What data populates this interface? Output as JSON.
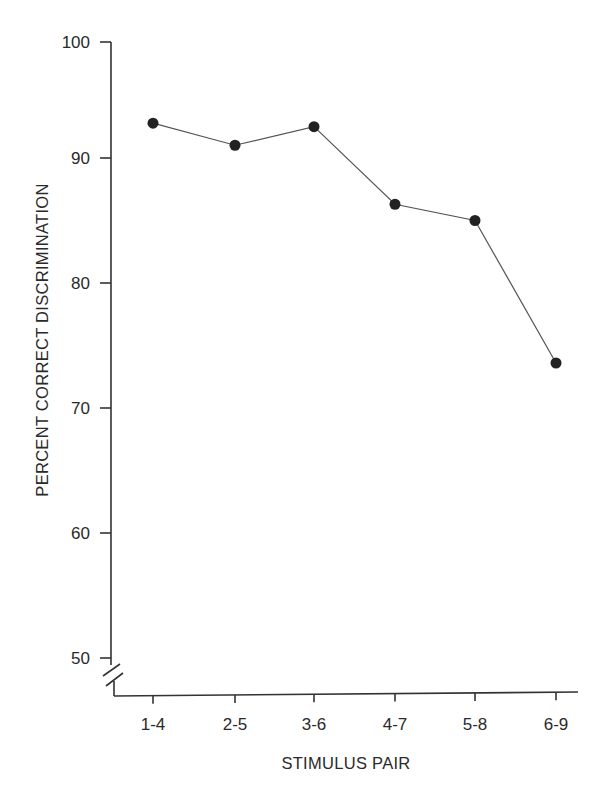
{
  "chart_data": {
    "type": "line",
    "title": "",
    "xlabel": "STIMULUS PAIR",
    "ylabel": "PERCENT CORRECT DISCRIMINATION",
    "categories": [
      "1-4",
      "2-5",
      "3-6",
      "4-7",
      "5-8",
      "6-9"
    ],
    "series": [
      {
        "name": "Percent correct",
        "values": [
          93.0,
          91.1,
          92.7,
          86.3,
          85.0,
          73.6
        ]
      }
    ],
    "ylim": [
      50,
      100
    ],
    "yticks": [
      50,
      60,
      70,
      80,
      90,
      100
    ],
    "ytick_labels": [
      "50",
      "60",
      "70",
      "80",
      "90",
      "100"
    ],
    "axis_break": "y-axis broken below 50",
    "grid": false,
    "legend": null,
    "marker": "filled-circle",
    "colors": {
      "line": "#555555",
      "marker": "#222222",
      "axis": "#333333"
    }
  }
}
